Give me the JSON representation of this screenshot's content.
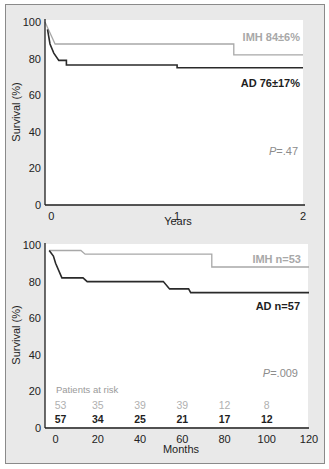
{
  "colors": {
    "imh": "#a8a8a8",
    "ad": "#2a2a2a",
    "panel_bg": "#e9e9e9",
    "plot_bg": "#ffffff",
    "axis": "#1e1e1e"
  },
  "chart_data": [
    {
      "type": "line",
      "subtype": "kaplan-meier step",
      "title": "",
      "xlabel": "Years",
      "ylabel": "Survival (%)",
      "xlim": [
        -0.05,
        2
      ],
      "ylim": [
        0,
        100
      ],
      "x_ticks": [
        "0",
        "1",
        "2"
      ],
      "y_ticks": [
        "0",
        "20",
        "40",
        "60",
        "80",
        "100"
      ],
      "grid": false,
      "series": [
        {
          "name": "IMH",
          "label": "IMH 84±6%",
          "points": [
            [
              -0.05,
              100
            ],
            [
              0.03,
              88
            ],
            [
              1.45,
              88
            ],
            [
              1.45,
              82
            ],
            [
              2.0,
              82
            ]
          ]
        },
        {
          "name": "AD",
          "label": "AD 76±17%",
          "points": [
            [
              -0.03,
              96
            ],
            [
              -0.01,
              88
            ],
            [
              0.02,
              83
            ],
            [
              0.06,
              79
            ],
            [
              0.12,
              79
            ],
            [
              0.12,
              76.5
            ],
            [
              1.0,
              76.5
            ],
            [
              1.0,
              75
            ],
            [
              2.0,
              75
            ]
          ]
        }
      ],
      "annotations": [
        "P=.47"
      ]
    },
    {
      "type": "line",
      "subtype": "kaplan-meier step",
      "title": "",
      "xlabel": "Months",
      "ylabel": "Survival (%)",
      "xlim": [
        -5,
        120
      ],
      "ylim": [
        0,
        100
      ],
      "x_ticks": [
        "0",
        "20",
        "40",
        "60",
        "80",
        "100",
        "120"
      ],
      "y_ticks": [
        "0",
        "20",
        "40",
        "60",
        "80",
        "100"
      ],
      "grid": false,
      "series": [
        {
          "name": "IMH",
          "label": "IMH n=53",
          "points": [
            [
              -3,
              97
            ],
            [
              12,
              97
            ],
            [
              14,
              95
            ],
            [
              74,
              95
            ],
            [
              74,
              88
            ],
            [
              120,
              88
            ]
          ]
        },
        {
          "name": "AD",
          "label": "AD n=57",
          "points": [
            [
              -3,
              97
            ],
            [
              -1,
              94
            ],
            [
              0,
              90
            ],
            [
              3,
              82
            ],
            [
              13,
              82
            ],
            [
              15,
              80
            ],
            [
              51,
              80
            ],
            [
              54,
              76
            ],
            [
              63,
              76
            ],
            [
              64,
              74
            ],
            [
              120,
              74
            ]
          ]
        }
      ],
      "annotations": [
        "P=.009"
      ],
      "patients_at_risk": {
        "title": "Patients at risk",
        "months": [
          0,
          20,
          40,
          60,
          80,
          100
        ],
        "IMH": [
          53,
          35,
          39,
          39,
          12,
          8
        ],
        "AD": [
          57,
          34,
          25,
          21,
          17,
          12
        ]
      }
    }
  ],
  "top": {
    "y_axis_label": "Survival (%)",
    "x_axis_label": "Years",
    "legend_imh": "IMH 84±6%",
    "legend_ad": "AD 76±17%",
    "p_italic": "P",
    "p_rest": "=.47"
  },
  "bottom": {
    "y_axis_label": "Survival (%)",
    "x_axis_label": "Months",
    "legend_imh": "IMH n=53",
    "legend_ad": "AD n=57",
    "p_italic": "P",
    "p_rest": "=.009",
    "risk_title": "Patients at risk"
  }
}
